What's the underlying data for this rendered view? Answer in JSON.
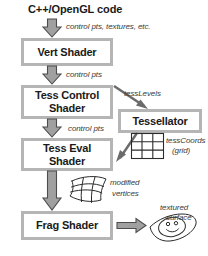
{
  "diagram": {
    "header": "C++/OpenGL code",
    "colors": {
      "box_border": "#b5b5b5",
      "box_fill": "#ffffff",
      "arrow_fill": "#a0a0a0",
      "arrow_stroke": "#4a4a4a",
      "text": "#1a1a1a",
      "label_text": "#3a3a3a",
      "icon_stroke": "#2b2b2b",
      "background": "#ffffff"
    },
    "stages": [
      {
        "id": "vert",
        "label": "Vert Shader"
      },
      {
        "id": "tess_control",
        "label": "Tess Control Shader"
      },
      {
        "id": "tessellator",
        "label": "Tessellator"
      },
      {
        "id": "tess_eval",
        "label": "Tess Eval Shader"
      },
      {
        "id": "frag",
        "label": "Frag Shader"
      }
    ],
    "edges": [
      {
        "id": "code-to-vert",
        "from": "C++/OpenGL code",
        "to": "Vert Shader",
        "label": "control pts, textures, etc.",
        "style": "block-arrow-down"
      },
      {
        "id": "vert-to-tcs",
        "from": "Vert Shader",
        "to": "Tess Control Shader",
        "label": "control pts",
        "style": "block-arrow-down"
      },
      {
        "id": "tcs-to-tessellator",
        "from": "Tess Control Shader",
        "to": "Tessellator",
        "label": "tessLevels",
        "style": "line-arrow-diagonal"
      },
      {
        "id": "tcs-to-tes",
        "from": "Tess Control Shader",
        "to": "Tess Eval Shader",
        "label": "control pts",
        "style": "block-arrow-down"
      },
      {
        "id": "tessellator-to-tes",
        "from": "Tessellator",
        "to": "Tess Eval Shader",
        "label": "tessCoords (grid)",
        "style": "line-arrow-diagonal"
      },
      {
        "id": "tes-to-frag",
        "from": "Tess Eval Shader",
        "to": "Frag Shader",
        "label": "modified vertices",
        "style": "block-arrow-down"
      },
      {
        "id": "frag-to-out",
        "from": "Frag Shader",
        "to": "textured surface",
        "label": "textured surface",
        "style": "block-arrow-right"
      }
    ],
    "labels": {
      "control_pts_textures": "control pts, textures, etc.",
      "control_pts_1": "control pts",
      "tess_levels": "tessLevels",
      "control_pts_2": "control pts",
      "tess_coords_line1": "tessCoords",
      "tess_coords_line2": "(grid)",
      "modified_line1": "modified",
      "modified_line2": "vertices",
      "textured_line1": "textured",
      "textured_line2": "surface"
    },
    "icons": [
      {
        "id": "grid-icon",
        "name": "regular grid of tessellation coordinates",
        "cells": "3x3"
      },
      {
        "id": "warped-mesh-icon",
        "name": "curved mesh of modified vertices",
        "cells": "3x3"
      },
      {
        "id": "textured-surface-icon",
        "name": "smiley face textured onto a warped quad"
      }
    ]
  }
}
